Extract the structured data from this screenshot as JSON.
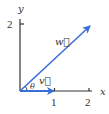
{
  "diagram": {
    "axes": {
      "x_label": "x",
      "y_label": "y",
      "x_ticks": [
        "1",
        "2"
      ],
      "y_ticks": [
        "2"
      ]
    },
    "vectors": [
      {
        "name": "w",
        "label": "w⃗",
        "from": [
          0,
          0
        ],
        "to": [
          2,
          2
        ],
        "color": "#3a6fd8"
      },
      {
        "name": "v",
        "label": "v⃗",
        "from": [
          0,
          0
        ],
        "to": [
          1,
          0
        ],
        "color": "#3a6fd8"
      }
    ],
    "angle_label": "θ",
    "colors": {
      "axis": "#333333",
      "vector": "#3a6fd8"
    }
  }
}
